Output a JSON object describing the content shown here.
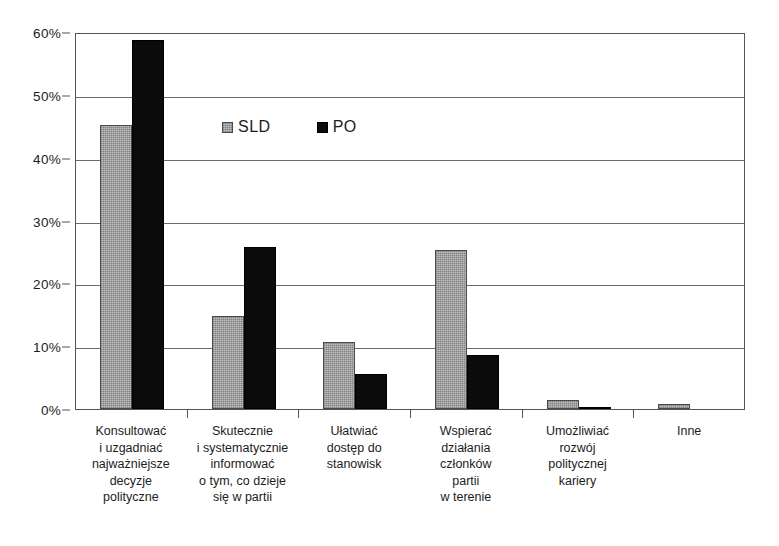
{
  "chart_data": {
    "type": "bar",
    "title": "",
    "subtitle": "",
    "xlabel": "",
    "ylabel": "",
    "ylim": [
      0,
      60
    ],
    "y_tick_labels": [
      "0%",
      "10%",
      "20%",
      "30%",
      "40%",
      "50%",
      "60%"
    ],
    "y_ticks": [
      0,
      10,
      20,
      30,
      40,
      50,
      60
    ],
    "grid": true,
    "legend_position": "inside-top-center",
    "value_unit": "%",
    "categories": [
      "Konsultować\ni uzgadniać\nnajważniejsze\ndecyzje\npolityczne",
      "Skutecznie\ni systematycznie\ninformować\no tym, co dzieje\nsię w partii",
      "Ułatwiać\ndostęp do\nstanowisk",
      "Wspierać\ndziałania\nczłonków\npartii\nw terenie",
      "Umożliwiać\nrozwój\npolitycznej\nkariery",
      "Inne"
    ],
    "series": [
      {
        "name": "SLD",
        "color": "#bdbdbd",
        "values": [
          45.2,
          14.8,
          10.6,
          25.3,
          1.4,
          0.8
        ]
      },
      {
        "name": "PO",
        "color": "#0b0b0b",
        "values": [
          58.7,
          25.8,
          5.5,
          8.6,
          0.4,
          0
        ]
      }
    ]
  },
  "legend": {
    "entries": [
      {
        "label": "SLD",
        "swatch": "gray-square-icon"
      },
      {
        "label": "PO",
        "swatch": "black-square-icon"
      }
    ]
  }
}
